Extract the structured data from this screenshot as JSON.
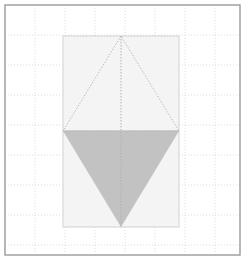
{
  "figure": {
    "type": "geometric-diagram",
    "canvas": {
      "width": 245,
      "height": 262,
      "background": "#ffffff"
    },
    "frame": {
      "name": "outer-border",
      "x": 5,
      "y": 5,
      "width": 235,
      "height": 250,
      "stroke": "#9a9a9a",
      "stroke_width": 1.4,
      "fill": "none"
    },
    "grid": {
      "spacing": 30,
      "origin_x": 5,
      "origin_y": 5,
      "x_lines": [
        35,
        65,
        95,
        125,
        155,
        185,
        215
      ],
      "y_lines": [
        35,
        65,
        95,
        125,
        155,
        185,
        215,
        245
      ],
      "stroke": "#d8d8d8",
      "stroke_width": 0.9,
      "dash": "1,2",
      "style": "dotted"
    },
    "rectangle": {
      "name": "backing-rectangle",
      "x": 63,
      "y": 36,
      "width": 116,
      "height": 191,
      "fill": "#f4f4f4",
      "stroke": "#d2d2d2",
      "stroke_width": 1
    },
    "upper_triangle": {
      "name": "upper-outlined-triangle",
      "points": "121,36 63,131 179,131",
      "apex": {
        "x": 121,
        "y": 36
      },
      "base_left": {
        "x": 63,
        "y": 131
      },
      "base_right": {
        "x": 179,
        "y": 131
      },
      "fill": "none",
      "stroke": "#b9b9b9",
      "stroke_width": 1,
      "dash": "1.4,1.6",
      "style": "dotted-outline"
    },
    "lower_triangle": {
      "name": "lower-filled-triangle",
      "points": "63,131 179,131 121,227",
      "apex": {
        "x": 121,
        "y": 227
      },
      "base_left": {
        "x": 63,
        "y": 131
      },
      "base_right": {
        "x": 179,
        "y": 131
      },
      "fill": "#c2c2c2",
      "stroke": "none",
      "style": "solid-fill"
    },
    "axis_line": {
      "name": "vertical-center-axis",
      "x": 121,
      "y1": 36,
      "y2": 227,
      "stroke": "#b0b0b0",
      "stroke_width": 1,
      "dash": "1.4,1.6",
      "style": "dotted"
    },
    "base_line": {
      "name": "shared-base-line",
      "x1": 63,
      "x2": 179,
      "y": 131,
      "stroke": "#b9b9b9",
      "stroke_width": 1,
      "style": "solid"
    },
    "colors": {
      "background": "#ffffff",
      "frame": "#9a9a9a",
      "grid": "#d8d8d8",
      "rectangle_fill": "#f4f4f4",
      "rectangle_stroke": "#d2d2d2",
      "triangle_fill": "#c2c2c2",
      "triangle_stroke": "#b9b9b9"
    }
  }
}
